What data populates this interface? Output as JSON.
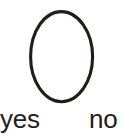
{
  "canvas": {
    "width": 125,
    "height": 134,
    "background_color": "#ffffff"
  },
  "diagram": {
    "kind": "ellipse-with-two-labels",
    "shape": {
      "name": "ellipse",
      "fill": "none",
      "stroke_color": "#211d1b",
      "stroke_width": 3,
      "center_x": 61.5,
      "center_y": 57,
      "radius_x": 31,
      "radius_y": 45
    },
    "labels": [
      {
        "id": "yes",
        "text": "yes",
        "x": 0,
        "y": 106,
        "color": "#211d1b",
        "font_size": 26
      },
      {
        "id": "no",
        "text": "no",
        "x": 89,
        "y": 106,
        "color": "#211d1b",
        "font_size": 26
      }
    ]
  }
}
